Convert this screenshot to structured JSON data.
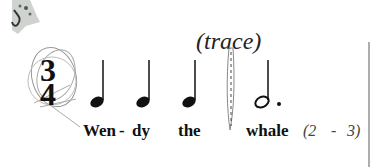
{
  "worksheet": {
    "instruction": "(trace)",
    "time_signature": {
      "top": "3",
      "bottom": "4"
    },
    "notes": [
      {
        "type": "quarter"
      },
      {
        "type": "quarter"
      },
      {
        "type": "quarter"
      },
      {
        "type": "dotted-half",
        "traced": true
      }
    ],
    "lyrics": [
      "Wen",
      "-",
      "dy",
      "the",
      "whale"
    ],
    "syllable_count": {
      "open": "(2",
      "dash": "-",
      "close": "3)"
    }
  }
}
